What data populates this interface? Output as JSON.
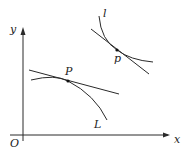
{
  "diagram": {
    "axes": {
      "x_label": "x",
      "y_label": "y",
      "origin_label": "O"
    },
    "curves": [
      {
        "name": "L",
        "label": "L",
        "point_label": "P",
        "description": "concave-down curve with tangent line at P"
      },
      {
        "name": "l",
        "label": "l",
        "point_label": "p",
        "description": "convex curve with tangent line at p"
      }
    ],
    "colors": {
      "stroke": "#2a2a2a",
      "background": "#ffffff"
    }
  }
}
